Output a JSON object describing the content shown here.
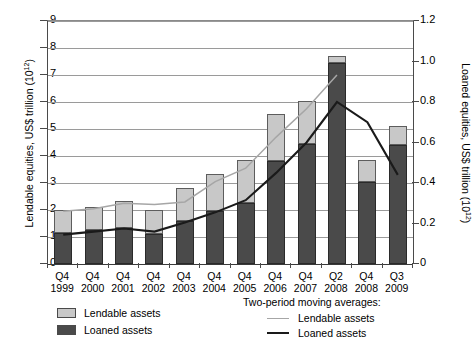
{
  "chart_data": {
    "type": "bar",
    "title": "",
    "subtitle": "",
    "categories": [
      "Q4 1999",
      "Q4 2000",
      "Q4 2001",
      "Q4 2002",
      "Q4 2003",
      "Q4 2004",
      "Q4 2005",
      "Q4 2006",
      "Q4 2007",
      "Q2 2008",
      "Q4 2008",
      "Q3 2009"
    ],
    "category_quarters": [
      "Q4",
      "Q4",
      "Q4",
      "Q4",
      "Q4",
      "Q4",
      "Q4",
      "Q4",
      "Q4",
      "Q2",
      "Q4",
      "Q3"
    ],
    "category_years": [
      "1999",
      "2000",
      "2001",
      "2002",
      "2003",
      "2004",
      "2005",
      "2006",
      "2007",
      "2008",
      "2008",
      "2009"
    ],
    "xlabel": "",
    "ylabel": "Lendable equities, US$ trillion (10",
    "ylabel_exp": "12",
    "ylabel_close": ")",
    "y2label": "Loaned equities, US$ trillion (10",
    "y2label_exp": "12",
    "y2label_close": ")",
    "ylim": [
      0,
      9
    ],
    "y2lim": [
      0,
      1.2
    ],
    "yticks": [
      0,
      1,
      2,
      3,
      4,
      5,
      6,
      7,
      8,
      9
    ],
    "y2ticks": [
      "0",
      "0.2",
      "0.4",
      "0.6",
      "0.8",
      "1.0",
      "1.2"
    ],
    "y2tick_values": [
      0,
      0.2,
      0.4,
      0.6,
      0.8,
      1.0,
      1.2
    ],
    "grid": true,
    "stacked": true,
    "legend_position": "below",
    "series": [
      {
        "name": "Lendable assets",
        "kind": "bar-segment-top",
        "color": "#c8c8c8",
        "axis": "left",
        "values": [
          2.0,
          2.1,
          2.35,
          2.0,
          2.8,
          3.35,
          3.85,
          5.55,
          6.05,
          7.7,
          3.85,
          5.1
        ]
      },
      {
        "name": "Loaned assets",
        "kind": "bar-segment-bottom",
        "color": "#4a4a4a",
        "axis": "left",
        "values": [
          1.15,
          1.25,
          1.35,
          1.1,
          1.6,
          1.95,
          2.25,
          3.8,
          4.45,
          7.45,
          3.05,
          4.4
        ]
      },
      {
        "name": "Lendable assets",
        "kind": "line",
        "color": "#a6a6a6",
        "axis": "left",
        "group": "Two-period moving averages",
        "values": [
          1.95,
          2.05,
          2.25,
          2.2,
          2.3,
          3.05,
          3.55,
          4.7,
          5.75,
          7.0,
          null,
          null
        ]
      },
      {
        "name": "Loaned assets",
        "kind": "line",
        "color": "#1a1a1a",
        "axis": "right",
        "group": "Two-period moving averages",
        "values": [
          0.145,
          0.16,
          0.175,
          0.16,
          0.205,
          0.255,
          0.315,
          0.45,
          0.6,
          0.8,
          0.7,
          0.44
        ]
      }
    ],
    "legend": {
      "bars": [
        "Lendable assets",
        "Loaned assets"
      ],
      "lines_header": "Two-period moving averages:",
      "lines": [
        "Lendable assets",
        "Loaned assets"
      ]
    }
  },
  "axes": {
    "left_title_pre": "Lendable equities, US$ trillion (10",
    "left_title_sup": "12",
    "left_title_post": ")",
    "right_title_pre": "Loaned equities, US$ trillion (10",
    "right_title_sup": "12",
    "right_title_post": ")"
  },
  "legend": {
    "bar_lendable": "Lendable assets",
    "bar_loaned": "Loaned assets",
    "ma_header": "Two-period moving averages:",
    "ma_lendable": "Lendable assets",
    "ma_loaned": "Loaned assets"
  },
  "colors": {
    "lendable_fill": "#c8c8c8",
    "loaned_fill": "#4a4a4a",
    "ma_lendable_line": "#a6a6a6",
    "ma_loaned_line": "#1a1a1a",
    "grid": "#9a9a9a",
    "axis": "#4a4a4a"
  }
}
